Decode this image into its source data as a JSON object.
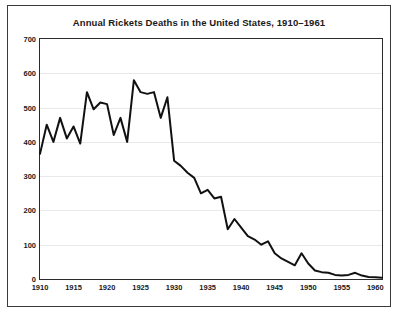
{
  "figure": {
    "title": "Annual Rickets Deaths in the United States, 1910–1961",
    "border_color": "#3a3a3a",
    "background": "#ffffff"
  },
  "chart_data": {
    "type": "line",
    "title": "Annual Rickets Deaths in the United States, 1910–1961",
    "xlabel": "",
    "ylabel": "",
    "xlim": [
      1910,
      1961
    ],
    "ylim": [
      0,
      700
    ],
    "grid": true,
    "legend": null,
    "line_color": "#111111",
    "line_width": 2,
    "yticks": [
      0,
      100,
      200,
      300,
      400,
      500,
      600,
      700
    ],
    "ytick_labels": [
      "0",
      "100",
      "200",
      "300",
      "400",
      "500",
      "600",
      "700"
    ],
    "xticks": [
      1910,
      1915,
      1920,
      1925,
      1930,
      1935,
      1940,
      1945,
      1950,
      1955,
      1960
    ],
    "xtick_labels": [
      "1910",
      "1915",
      "1920",
      "1925",
      "1930",
      "1935",
      "1940",
      "1945",
      "1950",
      "1955",
      "1960"
    ],
    "x": [
      1910,
      1911,
      1912,
      1913,
      1914,
      1915,
      1916,
      1917,
      1918,
      1919,
      1920,
      1921,
      1922,
      1923,
      1924,
      1925,
      1926,
      1927,
      1928,
      1929,
      1930,
      1931,
      1932,
      1933,
      1934,
      1935,
      1936,
      1937,
      1938,
      1939,
      1940,
      1941,
      1942,
      1943,
      1944,
      1945,
      1946,
      1947,
      1948,
      1949,
      1950,
      1951,
      1952,
      1953,
      1954,
      1955,
      1956,
      1957,
      1958,
      1959,
      1960,
      1961
    ],
    "values": [
      365,
      450,
      400,
      470,
      410,
      445,
      395,
      545,
      495,
      515,
      510,
      420,
      470,
      400,
      580,
      545,
      540,
      545,
      470,
      530,
      345,
      330,
      310,
      295,
      250,
      260,
      235,
      240,
      145,
      175,
      150,
      125,
      115,
      100,
      110,
      75,
      60,
      50,
      40,
      75,
      45,
      25,
      20,
      18,
      12,
      10,
      12,
      18,
      10,
      6,
      5,
      4
    ],
    "series_name": "Annual rickets deaths"
  }
}
